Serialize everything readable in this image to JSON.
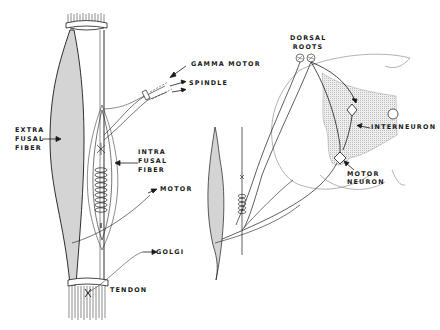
{
  "diagram": {
    "colors": {
      "ink": "#1a1a1a",
      "muscle_fill": "#d4d4d4",
      "grey_matter_fill": "#e3e3e3",
      "background": "#ffffff"
    },
    "left_panel": {
      "labels": {
        "gamma_motor": "GAMMA MOTOR",
        "spindle": "SPINDLE",
        "extrafusal_line1": "EXTRA",
        "extrafusal_line2": "FUSAL",
        "extrafusal_line3": "FIBER",
        "intrafusal_line1": "INTRA",
        "intrafusal_line2": "FUSAL",
        "intrafusal_line3": "FIBER",
        "motor": "MOTOR",
        "golgi": "GOLGI",
        "tendon": "TENDON"
      }
    },
    "right_panel": {
      "labels": {
        "dorsal_line1": "DORSAL",
        "dorsal_line2": "ROOTS",
        "interneuron": "INTERNEURON",
        "motor_neuron_line1": "MOTOR",
        "motor_neuron_line2": "NEURON"
      }
    }
  }
}
